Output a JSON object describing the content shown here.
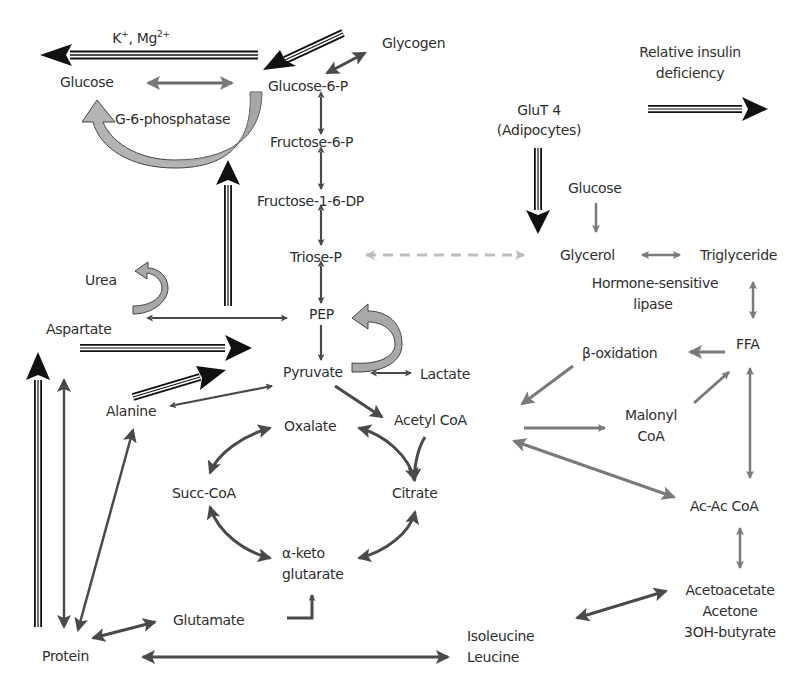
{
  "diagram": {
    "colors": {
      "text": "#2e2e2e",
      "dark_arrow": "#4a4a4a",
      "black_arrow": "#111111",
      "mid_grey_arrow": "#7a7a7a",
      "light_grey_dashed": "#bdbdbd",
      "curved_arrow_fill": "#a8a8a8",
      "curved_arrow_fill_light": "#c8c8c8"
    },
    "nodes": {
      "k_mg": {
        "text": "K",
        "sup1": "+",
        "mid": ", Mg",
        "sup2": "2+"
      },
      "glycogen": "Glycogen",
      "glucose_liver": "Glucose",
      "glucose_6_p": "Glucose-6-P",
      "g6_phosphatase": "G-6-phosphatase",
      "fructose_6_p": "Fructose-6-P",
      "fructose_1_6_dp": "Fructose-1-6-DP",
      "triose_p": "Triose-P",
      "pep": "PEP",
      "pyruvate": "Pyruvate",
      "lactate": "Lactate",
      "urea": "Urea",
      "aspartate": "Aspartate",
      "alanine": "Alanine",
      "acetyl_coa": "Acetyl CoA",
      "oxalate": "Oxalate",
      "citrate": "Citrate",
      "succ_coa": "Succ-CoA",
      "alpha_keto_1": "α-keto",
      "alpha_keto_2": "glutarate",
      "glutamate": "Glutamate",
      "protein": "Protein",
      "isoleucine": "Isoleucine",
      "leucine": "Leucine",
      "relative_insulin_1": "Relative insulin",
      "relative_insulin_2": "deficiency",
      "glut4_1": "GluT 4",
      "glut4_2": "(Adipocytes)",
      "glucose_adipo": "Glucose",
      "glycerol": "Glycerol",
      "triglyceride": "Triglyceride",
      "hsl_1": "Hormone-sensitive",
      "hsl_2": "lipase",
      "ffa": "FFA",
      "beta_oxidation": "β-oxidation",
      "malonyl_1": "Malonyl",
      "malonyl_2": "CoA",
      "acac_coa": "Ac-Ac CoA",
      "ketone_1": "Acetoacetate",
      "ketone_2": "Acetone",
      "ketone_3": "3OH-butyrate"
    },
    "edges": [
      {
        "from": "Glucose-6-P",
        "to": "Glucose",
        "style": "triple-black",
        "label": "K+, Mg2+"
      },
      {
        "from": "Glycogen",
        "to": "Glucose-6-P",
        "style": "triple-black"
      },
      {
        "from": "Glycogen",
        "to": "Glucose-6-P",
        "style": "double-headed-dark"
      },
      {
        "from": "Glucose",
        "to": "Glucose-6-P",
        "style": "double-headed-grey"
      },
      {
        "from": "Glucose-6-P",
        "to": "Glucose",
        "style": "curved-block",
        "label": "G-6-phosphatase"
      },
      {
        "from": "Glucose-6-P",
        "to": "Fructose-6-P",
        "style": "double-headed-dark"
      },
      {
        "from": "Fructose-6-P",
        "to": "Fructose-1-6-DP",
        "style": "double-headed-dark"
      },
      {
        "from": "Fructose-1-6-DP",
        "to": "Triose-P",
        "style": "double-headed-dark"
      },
      {
        "from": "Triose-P",
        "to": "PEP",
        "style": "double-headed-dark"
      },
      {
        "from": "PEP",
        "to": "Pyruvate",
        "style": "dark"
      },
      {
        "from": "Pyruvate",
        "to": "PEP",
        "style": "curved-block"
      },
      {
        "from": "Pyruvate",
        "to": "Lactate",
        "style": "double-headed-dark"
      },
      {
        "from": "Pyruvate",
        "to": "Acetyl CoA",
        "style": "dark"
      },
      {
        "from": "Aspartate",
        "to": "PEP",
        "style": "double-headed-dark"
      },
      {
        "from": "Aspartate",
        "to": "Urea",
        "style": "curved-block"
      },
      {
        "from": "Aspartate",
        "to": "Pyruvate",
        "style": "triple-black"
      },
      {
        "from": "Alanine",
        "to": "Pyruvate",
        "style": "triple-black"
      },
      {
        "from": "Alanine",
        "to": "Pyruvate",
        "style": "double-headed-dark"
      },
      {
        "from": "PEP-region",
        "to": "Glucose",
        "style": "triple-black"
      },
      {
        "from": "Protein",
        "to": "Aspartate",
        "style": "triple-black"
      },
      {
        "from": "Protein",
        "to": "Aspartate",
        "style": "double-headed-dark"
      },
      {
        "from": "Protein",
        "to": "Alanine",
        "style": "double-headed-dark"
      },
      {
        "from": "Protein",
        "to": "Glutamate",
        "style": "double-headed-dark"
      },
      {
        "from": "Protein",
        "to": "Isoleucine/Leucine",
        "style": "double-headed-dark"
      },
      {
        "from": "Glutamate",
        "to": "α-keto glutarate",
        "style": "elbow-dark"
      },
      {
        "from": "Oxalate",
        "to": "Succ-CoA",
        "style": "curved-double-dark"
      },
      {
        "from": "Succ-CoA",
        "to": "α-keto glutarate",
        "style": "curved-double-dark"
      },
      {
        "from": "α-keto glutarate",
        "to": "Citrate",
        "style": "curved-double-dark"
      },
      {
        "from": "Citrate",
        "to": "Oxalate",
        "style": "curved-double-dark"
      },
      {
        "from": "Acetyl CoA",
        "to": "Citrate",
        "style": "curved-dark"
      },
      {
        "from": "Triose-P",
        "to": "Glycerol",
        "style": "dashed-light-double"
      },
      {
        "from": "GluT 4",
        "to": "Glycerol",
        "style": "triple-black"
      },
      {
        "from": "Relative insulin deficiency",
        "to": "",
        "style": "triple-black"
      },
      {
        "from": "Glucose (adipocyte)",
        "to": "Glycerol",
        "style": "grey"
      },
      {
        "from": "Glycerol",
        "to": "Triglyceride",
        "style": "double-headed-grey"
      },
      {
        "from": "Triglyceride",
        "to": "FFA",
        "style": "double-headed-grey"
      },
      {
        "from": "FFA",
        "to": "β-oxidation",
        "style": "grey"
      },
      {
        "from": "β-oxidation",
        "to": "Acetyl CoA",
        "style": "grey"
      },
      {
        "from": "Acetyl CoA",
        "to": "Malonyl CoA",
        "style": "grey"
      },
      {
        "from": "Malonyl CoA",
        "to": "FFA",
        "style": "grey"
      },
      {
        "from": "FFA",
        "to": "Ac-Ac CoA",
        "style": "double-headed-grey"
      },
      {
        "from": "Acetyl CoA",
        "to": "Ac-Ac CoA",
        "style": "double-headed-grey"
      },
      {
        "from": "Ac-Ac CoA",
        "to": "Acetoacetate/Acetone/3OH-butyrate",
        "style": "double-headed-grey"
      },
      {
        "from": "Isoleucine/Leucine",
        "to": "Acetoacetate/Acetone/3OH-butyrate",
        "style": "double-headed-dark"
      }
    ]
  }
}
